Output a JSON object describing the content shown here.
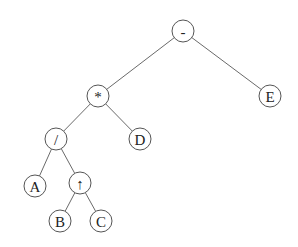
{
  "diagram": {
    "type": "expression-tree",
    "node_radius": 11,
    "nodes": [
      {
        "id": "minus",
        "label": "-",
        "x": 183,
        "y": 31
      },
      {
        "id": "times",
        "label": "*",
        "x": 98,
        "y": 96
      },
      {
        "id": "E",
        "label": "E",
        "x": 270,
        "y": 96
      },
      {
        "id": "divide",
        "label": "/",
        "x": 56,
        "y": 139
      },
      {
        "id": "D",
        "label": "D",
        "x": 140,
        "y": 139
      },
      {
        "id": "A",
        "label": "A",
        "x": 35,
        "y": 186
      },
      {
        "id": "up",
        "label": "↑",
        "x": 80,
        "y": 183
      },
      {
        "id": "B",
        "label": "B",
        "x": 60,
        "y": 221
      },
      {
        "id": "C",
        "label": "C",
        "x": 101,
        "y": 221
      }
    ],
    "edges": [
      {
        "from": "minus",
        "to": "times"
      },
      {
        "from": "minus",
        "to": "E"
      },
      {
        "from": "times",
        "to": "divide"
      },
      {
        "from": "times",
        "to": "D"
      },
      {
        "from": "divide",
        "to": "A"
      },
      {
        "from": "divide",
        "to": "up"
      },
      {
        "from": "up",
        "to": "B"
      },
      {
        "from": "up",
        "to": "C"
      }
    ]
  }
}
